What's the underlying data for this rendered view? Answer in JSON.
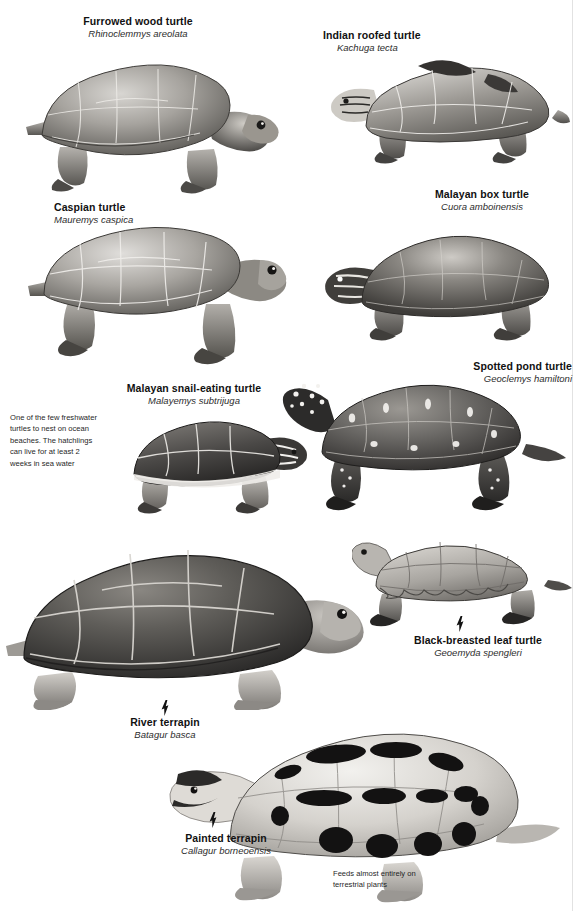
{
  "page": {
    "background_color": "#ffffff",
    "rule_color": "#e2e2e2",
    "width": 578,
    "height": 911
  },
  "species": [
    {
      "id": "furrowed-wood-turtle",
      "common": "Furrowed wood turtle",
      "latin": "Rhinoclemmys areolata"
    },
    {
      "id": "indian-roofed-turtle",
      "common": "Indian roofed turtle",
      "latin": "Kachuga tecta"
    },
    {
      "id": "caspian-turtle",
      "common": "Caspian turtle",
      "latin": "Mauremys caspica"
    },
    {
      "id": "malayan-box-turtle",
      "common": "Malayan box turtle",
      "latin": "Cuora amboinensis"
    },
    {
      "id": "malayan-snail-eating-turtle",
      "common": "Malayan snail-eating turtle",
      "latin": "Malayemys subtrijuga"
    },
    {
      "id": "spotted-pond-turtle",
      "common": "Spotted pond turtle",
      "latin": "Geoclemys hamiltoni"
    },
    {
      "id": "black-breasted-leaf-turtle",
      "common": "Black-breasted leaf turtle",
      "latin": "Geoemyda spengleri"
    },
    {
      "id": "river-terrapin",
      "common": "River terrapin",
      "latin": "Batagur basca"
    },
    {
      "id": "painted-terrapin",
      "common": "Painted terrapin",
      "latin": "Callagur borneoensis"
    }
  ],
  "captions": {
    "sea_water": "One of the few freshwater turtles to nest on ocean beaches. The hatchlings can live for at least 2 weeks in sea water",
    "terrestrial_plants": "Feeds almost entirely on terrestrial plants"
  }
}
